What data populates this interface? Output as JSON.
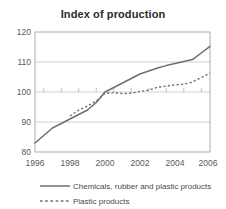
{
  "chart_data": {
    "type": "line",
    "title": "Index of production",
    "xlabel": "",
    "ylabel": "",
    "xlim": [
      1996,
      2006
    ],
    "ylim": [
      80,
      120
    ],
    "grid": true,
    "legend_position": "bottom",
    "x_ticks": [
      "1996",
      "1998",
      "2000",
      "2002",
      "2004",
      "2006"
    ],
    "y_ticks": [
      "80",
      "90",
      "100",
      "110",
      "120"
    ],
    "x": [
      1996,
      1996.5,
      1997,
      1997.5,
      1998,
      1998.5,
      1999,
      1999.5,
      2000,
      2000.5,
      2001,
      2001.5,
      2002,
      2002.5,
      2003,
      2003.5,
      2004,
      2004.5,
      2005,
      2005.5,
      2006
    ],
    "series": [
      {
        "name": "Chemicals, rubber and plastic products",
        "style": "solid",
        "color": "#6f6f6f",
        "values": [
          83.0,
          85.5,
          88.0,
          89.5,
          91.0,
          92.5,
          94.0,
          96.5,
          100.0,
          101.5,
          103.0,
          104.5,
          106.0,
          107.0,
          108.0,
          108.8,
          109.5,
          110.2,
          110.8,
          113.0,
          115.2
        ]
      },
      {
        "name": "Plastic products",
        "style": "dashed",
        "color": "#6f6f6f",
        "values": [
          null,
          null,
          null,
          null,
          92.0,
          94.0,
          95.3,
          97.0,
          99.5,
          99.8,
          99.5,
          99.6,
          100.2,
          100.6,
          101.6,
          102.0,
          102.4,
          102.6,
          103.3,
          104.8,
          106.3
        ]
      }
    ]
  },
  "legend": {
    "entries": [
      {
        "label": "Chemicals, rubber and plastic products",
        "style": "solid"
      },
      {
        "label": "Plastic products",
        "style": "dashed"
      }
    ]
  }
}
